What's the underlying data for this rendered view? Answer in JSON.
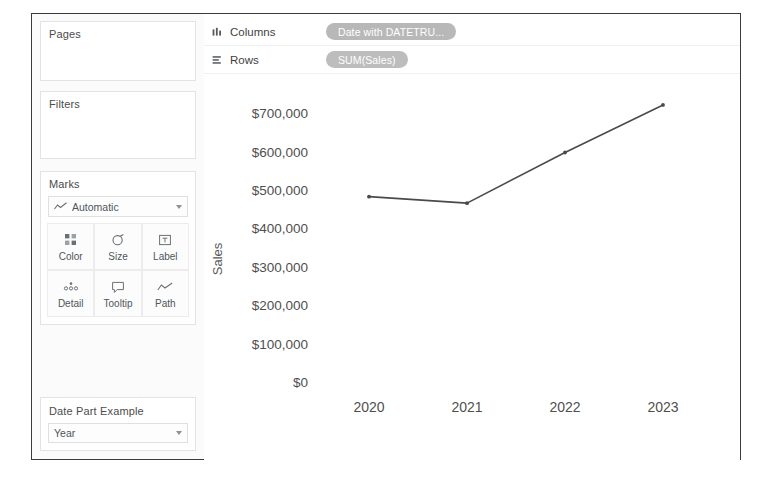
{
  "app": {
    "panels": {
      "pages": {
        "title": "Pages"
      },
      "filters": {
        "title": "Filters"
      },
      "marks": {
        "title": "Marks",
        "type_label": "Automatic",
        "type_icon": "line-chart-icon",
        "buttons": [
          {
            "label": "Color",
            "icon": "color-squares-icon"
          },
          {
            "label": "Size",
            "icon": "size-circle-icon"
          },
          {
            "label": "Label",
            "icon": "label-text-icon"
          },
          {
            "label": "Detail",
            "icon": "detail-dots-icon"
          },
          {
            "label": "Tooltip",
            "icon": "tooltip-bubble-icon"
          },
          {
            "label": "Path",
            "icon": "path-line-icon"
          }
        ]
      },
      "date_part": {
        "title": "Date Part Example",
        "selected": "Year"
      }
    },
    "shelves": [
      {
        "name": "Columns",
        "icon": "columns-icon",
        "pill": "Date with DATETRU..."
      },
      {
        "name": "Rows",
        "icon": "rows-icon",
        "pill": "SUM(Sales)"
      }
    ]
  },
  "chart_data": {
    "type": "line",
    "title": "",
    "xlabel": "",
    "ylabel": "Sales",
    "categories": [
      "2020",
      "2021",
      "2022",
      "2023"
    ],
    "values": [
      483000,
      466000,
      598000,
      722000
    ],
    "ytick_labels": [
      "$700,000",
      "$600,000",
      "$500,000",
      "$400,000",
      "$300,000",
      "$200,000",
      "$100,000",
      "$0"
    ],
    "ytick_values": [
      700000,
      600000,
      500000,
      400000,
      300000,
      200000,
      100000,
      0
    ],
    "ylim": [
      0,
      740000
    ],
    "grid": false,
    "legend": "none",
    "line_color": "#4a4a4a",
    "marker": "dot"
  }
}
